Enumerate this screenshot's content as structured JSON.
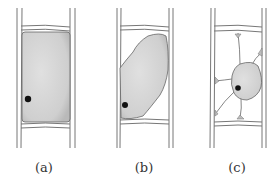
{
  "figure": {
    "panels": [
      {
        "label": "(a)",
        "state": "turgid cell, protoplast fills cell"
      },
      {
        "label": "(b)",
        "state": "protoplast shrinking from cell wall"
      },
      {
        "label": "(c)",
        "state": "protoplast contracted, held by strands"
      }
    ]
  },
  "colors": {
    "cytoplasm": "#d2d2d2",
    "outline": "#555555",
    "nucleus": "#111111",
    "wall": "#777777"
  }
}
